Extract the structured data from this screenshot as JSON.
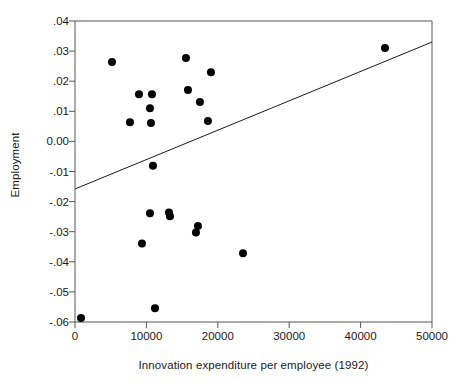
{
  "chart_data": {
    "type": "scatter",
    "title": "",
    "xlabel": "Innovation expenditure per employee (1992)",
    "ylabel": "Employment",
    "xlim": [
      0,
      50000
    ],
    "ylim": [
      -0.06,
      0.04
    ],
    "grid": false,
    "legend": null,
    "xticks": [
      0,
      10000,
      20000,
      30000,
      40000,
      50000
    ],
    "xticklabels": [
      "0",
      "10000",
      "20000",
      "30000",
      "40000",
      "50000"
    ],
    "yticks": [
      0.04,
      0.03,
      0.02,
      0.01,
      0.0,
      -0.01,
      -0.02,
      -0.03,
      -0.04,
      -0.05,
      -0.06
    ],
    "yticklabels": [
      ".04",
      ".03",
      ".02",
      ".01",
      "0.00",
      "-.01",
      "-.02",
      "-.03",
      "-.04",
      "-.05",
      "-.06"
    ],
    "marker": "filled-circle",
    "marker_color": "#000000",
    "marker_size": 5.2,
    "points": [
      {
        "x": 840,
        "y": -0.0587
      },
      {
        "x": 5180,
        "y": 0.0264
      },
      {
        "x": 8960,
        "y": 0.0157
      },
      {
        "x": 7700,
        "y": 0.0064
      },
      {
        "x": 10780,
        "y": 0.0157
      },
      {
        "x": 10500,
        "y": 0.011
      },
      {
        "x": 10640,
        "y": 0.0061
      },
      {
        "x": 9380,
        "y": -0.0339
      },
      {
        "x": 11200,
        "y": -0.0554
      },
      {
        "x": 10500,
        "y": -0.0239
      },
      {
        "x": 13160,
        "y": -0.0236
      },
      {
        "x": 13300,
        "y": -0.0249
      },
      {
        "x": 15540,
        "y": 0.0277
      },
      {
        "x": 19040,
        "y": 0.023
      },
      {
        "x": 15820,
        "y": 0.0171
      },
      {
        "x": 17500,
        "y": 0.0131
      },
      {
        "x": 18620,
        "y": 0.0068
      },
      {
        "x": 16940,
        "y": -0.0303
      },
      {
        "x": 17220,
        "y": -0.0281
      },
      {
        "x": 10920,
        "y": -0.0081
      },
      {
        "x": 23530,
        "y": -0.0372
      },
      {
        "x": 43420,
        "y": 0.031
      }
    ],
    "fit_line": {
      "name": "linear-fit",
      "x_start": 0,
      "y_start": -0.0158,
      "x_end": 50000,
      "y_end": 0.033,
      "color": "#1a1a1a",
      "width": 1
    },
    "axes": {
      "frame_color": "#555555",
      "background": "#ffffff"
    }
  }
}
